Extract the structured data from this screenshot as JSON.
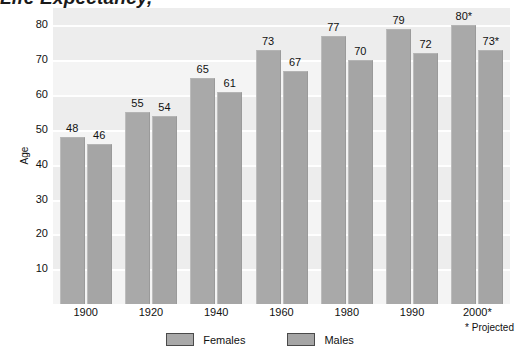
{
  "title": {
    "text": "Life Expectancy,",
    "note": "* Projected"
  },
  "axes": {
    "y_label": "Age",
    "y_ticks": [
      "80",
      "70",
      "60",
      "50",
      "40",
      "30",
      "20",
      "10"
    ]
  },
  "legend": {
    "items": [
      {
        "label": "Females",
        "color": "#a9a9a9"
      },
      {
        "label": "Males",
        "color": "#a5a5a5"
      }
    ]
  },
  "chart_data": {
    "type": "bar",
    "title": "Life Expectancy,",
    "xlabel": "",
    "ylabel": "Age",
    "ylim": [
      0,
      85
    ],
    "yticks": [
      10,
      20,
      30,
      40,
      50,
      60,
      70,
      80
    ],
    "grid": true,
    "legend_position": "bottom",
    "categories": [
      "1900",
      "1920",
      "1940",
      "1960",
      "1980",
      "1990",
      "2000*"
    ],
    "series": [
      {
        "name": "Females",
        "values": [
          48,
          55,
          65,
          73,
          77,
          79,
          80
        ],
        "labels": [
          "48",
          "55",
          "65",
          "73",
          "77",
          "79",
          "80*"
        ]
      },
      {
        "name": "Males",
        "values": [
          46,
          54,
          61,
          67,
          70,
          72,
          73
        ],
        "labels": [
          "46",
          "54",
          "61",
          "67",
          "70",
          "72",
          "73*"
        ]
      }
    ],
    "annotations": [
      "* Projected"
    ]
  }
}
